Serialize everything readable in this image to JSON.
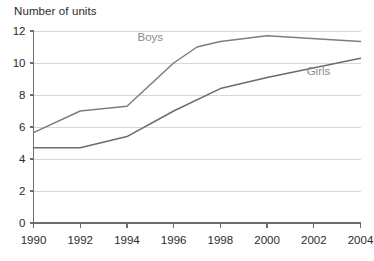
{
  "chart_data": {
    "type": "line",
    "title": "Number of units",
    "xlabel": "",
    "ylabel": "",
    "ylim": [
      0,
      12
    ],
    "xlim": [
      1990,
      2004
    ],
    "grid": true,
    "legend_position": "inline-labels",
    "y_ticks": [
      "0",
      "2",
      "4",
      "6",
      "8",
      "10",
      "12"
    ],
    "y_tick_values": [
      0,
      2,
      4,
      6,
      8,
      10,
      12
    ],
    "x_ticks": [
      "1990",
      "1992",
      "1994",
      "1996",
      "1998",
      "2000",
      "2002",
      "2004"
    ],
    "x_tick_values": [
      1990,
      1992,
      1994,
      1996,
      1998,
      2000,
      2002,
      2004
    ],
    "series": [
      {
        "name": "Boys",
        "color": "#7d7d7d",
        "label_x": 1995.0,
        "label_y": 11.35,
        "x": [
          1990,
          1992,
          1994,
          1996,
          1997,
          1998,
          2000,
          2004
        ],
        "values": [
          5.65,
          7.0,
          7.3,
          10.0,
          11.0,
          11.35,
          11.7,
          11.35
        ]
      },
      {
        "name": "Girls",
        "color": "#6b6b6b",
        "label_x": 2002.2,
        "label_y": 9.25,
        "x": [
          1990,
          1992,
          1994,
          1996,
          1998,
          2000,
          2004
        ],
        "values": [
          4.7,
          4.7,
          5.4,
          7.0,
          8.4,
          9.1,
          10.3
        ]
      }
    ]
  },
  "axes": {
    "y_axis_name": "value-axis",
    "x_axis_name": "year-axis"
  }
}
